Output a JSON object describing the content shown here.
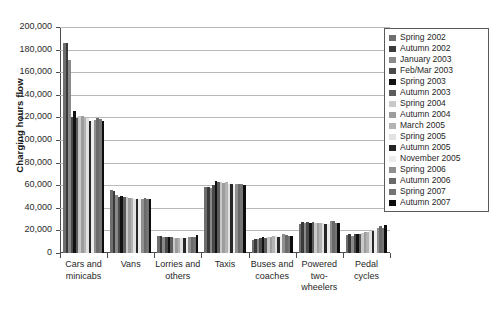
{
  "chart_data": {
    "type": "bar",
    "title": "",
    "subtitle": "",
    "xlabel": "",
    "ylabel": "Charging hours flow",
    "ylim": [
      0,
      200000
    ],
    "ytick_step": 20000,
    "ytick_labels": [
      "200,000",
      "180,000",
      "160,000",
      "140,000",
      "120,000",
      "100,000",
      "80,000",
      "60,000",
      "40,000",
      "20,000",
      "0"
    ],
    "grid": true,
    "grid_axis": "y",
    "legend_position": "right-inside",
    "categories": [
      "Cars and minicabs",
      "Vans",
      "Lorries and others",
      "Taxis",
      "Buses and coaches",
      "Powered two-wheelers",
      "Pedal cycles"
    ],
    "series": [
      {
        "name": "Spring 2002",
        "color": "#6e6e6e",
        "values": [
          185500,
          56000,
          15500,
          58500,
          11500,
          26000,
          16000
        ]
      },
      {
        "name": "Autumn 2002",
        "color": "#3a3a3a",
        "values": [
          186000,
          55000,
          15000,
          58000,
          12000,
          27500,
          16500
        ]
      },
      {
        "name": "January 2003",
        "color": "#8a8a8a",
        "values": [
          170500,
          51000,
          14500,
          57500,
          12500,
          27000,
          15500
        ]
      },
      {
        "name": "Feb/Mar 2003",
        "color": "#4a4a4a",
        "values": [
          120000,
          50000,
          14500,
          60500,
          13000,
          27500,
          16500
        ]
      },
      {
        "name": "Spring 2003",
        "color": "#111111",
        "values": [
          126000,
          50500,
          14000,
          63500,
          14000,
          27000,
          17000
        ]
      },
      {
        "name": "Autumn 2003",
        "color": "#5c5c5c",
        "values": [
          119500,
          50000,
          14000,
          63000,
          13500,
          27500,
          17000
        ]
      },
      {
        "name": "Spring 2004",
        "color": "#c9c9c9",
        "values": [
          121000,
          49500,
          13500,
          62500,
          14000,
          26500,
          18000
        ]
      },
      {
        "name": "Autumn 2004",
        "color": "#9d9d9d",
        "values": [
          121500,
          49000,
          13500,
          62000,
          14500,
          27000,
          18500
        ]
      },
      {
        "name": "March 2005",
        "color": "#b3b3b3",
        "values": [
          120000,
          48500,
          13500,
          62500,
          15000,
          26500,
          19000
        ]
      },
      {
        "name": "Spring 2005",
        "color": "#e2e2e2",
        "values": [
          119500,
          48000,
          13000,
          61500,
          15000,
          26500,
          19500
        ]
      },
      {
        "name": "Autumn 2005",
        "color": "#262626",
        "values": [
          117000,
          47500,
          13000,
          61000,
          14000,
          25500,
          19500
        ]
      },
      {
        "name": "November 2005",
        "color": "#ededed",
        "values": [
          117000,
          47500,
          13000,
          60500,
          15500,
          26000,
          20500
        ]
      },
      {
        "name": "Spring 2006",
        "color": "#8f8f8f",
        "values": [
          118000,
          48000,
          14000,
          61000,
          16500,
          28500,
          22500
        ]
      },
      {
        "name": "Autumn 2006",
        "color": "#6a6a6a",
        "values": [
          119500,
          48500,
          14500,
          61500,
          16000,
          28000,
          23500
        ]
      },
      {
        "name": "Spring 2007",
        "color": "#757575",
        "values": [
          118500,
          48000,
          14000,
          61000,
          15500,
          27000,
          22000
        ]
      },
      {
        "name": "Autumn 2007",
        "color": "#0d0d0d",
        "values": [
          117000,
          47500,
          16000,
          60000,
          15500,
          26500,
          25000
        ]
      }
    ]
  }
}
